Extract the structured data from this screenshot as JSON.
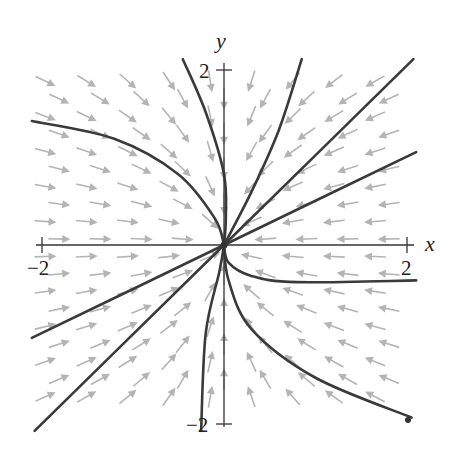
{
  "chart_data": {
    "type": "phase_portrait",
    "title": "",
    "xlabel": "x",
    "ylabel": "y",
    "xlim": [
      -2,
      2
    ],
    "ylim": [
      -2,
      2
    ],
    "x_ticks": [
      -2,
      2
    ],
    "y_ticks": [
      -2,
      2
    ],
    "x_tick_labels": [
      "−2",
      "2"
    ],
    "y_tick_labels": [
      "2",
      "−2"
    ],
    "grid": false,
    "legend": null,
    "equilibrium": {
      "x": 0,
      "y": 0,
      "type": "stable node"
    },
    "trajectories": [
      {
        "name": "upper-left curve",
        "points": [
          [
            -2.1,
            1.4
          ],
          [
            -1.2,
            1.2
          ],
          [
            -0.5,
            0.8
          ],
          [
            -0.1,
            0.3
          ],
          [
            0,
            0
          ]
        ]
      },
      {
        "name": "steep upper-left curve",
        "points": [
          [
            -0.45,
            2.1
          ],
          [
            -0.2,
            1.5
          ],
          [
            0.0,
            0.8
          ],
          [
            0.02,
            0.3
          ],
          [
            0,
            0
          ]
        ]
      },
      {
        "name": "upper curve",
        "points": [
          [
            0.85,
            2.1
          ],
          [
            0.6,
            1.3
          ],
          [
            0.3,
            0.6
          ],
          [
            0,
            0
          ]
        ]
      },
      {
        "name": "upper-right line",
        "points": [
          [
            2.07,
            2.1
          ],
          [
            0,
            0
          ]
        ]
      },
      {
        "name": "right line",
        "points": [
          [
            2.1,
            1.05
          ],
          [
            0,
            0
          ]
        ]
      },
      {
        "name": "right curve",
        "points": [
          [
            2.1,
            -0.4
          ],
          [
            0.8,
            -0.42
          ],
          [
            0.3,
            -0.35
          ],
          [
            0.05,
            -0.2
          ],
          [
            0,
            0
          ]
        ]
      },
      {
        "name": "lower-right curve",
        "points": [
          [
            2.05,
            -1.95
          ],
          [
            1.0,
            -1.5
          ],
          [
            0.3,
            -0.95
          ],
          [
            0.05,
            -0.4
          ],
          [
            0,
            0
          ]
        ]
      },
      {
        "name": "lower curve",
        "points": [
          [
            -0.25,
            -2.1
          ],
          [
            -0.2,
            -1.0
          ],
          [
            -0.05,
            -0.3
          ],
          [
            0,
            0
          ]
        ]
      },
      {
        "name": "lower-left line",
        "points": [
          [
            -2.1,
            -1.05
          ],
          [
            0,
            0
          ]
        ]
      },
      {
        "name": "lower-left steep line",
        "points": [
          [
            -2.07,
            -2.1
          ],
          [
            0,
            0
          ]
        ]
      }
    ],
    "field_note": "Gray arrows point inward toward the origin"
  },
  "axes": {
    "x_label": "x",
    "y_label": "y",
    "x_min_label": "−2",
    "x_max_label": "2",
    "y_max_label": "2",
    "y_min_label": "−2"
  },
  "colors": {
    "trajectory": "#3a3a3a",
    "field_arrow": "#b4b4b4",
    "axis": "#333333",
    "background": "#ffffff"
  },
  "layout": {
    "origin_px": [
      224,
      245
    ],
    "unit_px_x": 91.5,
    "unit_px_y": 88.5
  }
}
